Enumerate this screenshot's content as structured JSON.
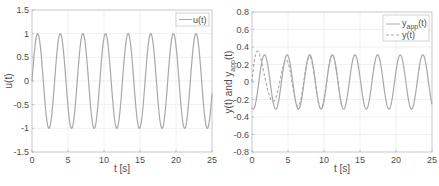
{
  "chart_data": [
    {
      "type": "line",
      "title": "",
      "xlabel": "t [s]",
      "ylabel": "u(t)",
      "xlim": [
        0,
        25
      ],
      "ylim": [
        -1.5,
        1.5
      ],
      "xticks": [
        0,
        5,
        10,
        15,
        20,
        25
      ],
      "yticks": [
        -1.5,
        -1,
        -0.5,
        0,
        0.5,
        1,
        1.5
      ],
      "ytick_labels": [
        "-1.5",
        "-1",
        "-0.5",
        "0",
        "0.5",
        "1",
        "1.5"
      ],
      "grid": true,
      "legend_position": "northeast",
      "series": [
        {
          "name": "u(t)",
          "style": "solid",
          "color": "#a8a8a8",
          "formula": "sin(2t)",
          "amplitude": 1.0,
          "angular_frequency": 2.0,
          "phase": 0.0,
          "x": [
            0,
            0.785,
            2.356,
            3.927,
            5.498,
            7.069,
            8.639,
            10.21,
            11.78,
            13.35,
            14.92,
            16.49,
            18.06,
            19.63,
            21.21,
            22.78,
            24.35,
            25
          ],
          "values": [
            0,
            1,
            -1,
            1,
            -1,
            1,
            -1,
            1,
            -1,
            1,
            -1,
            1,
            -1,
            1,
            -1,
            1,
            -1,
            -0.26
          ]
        }
      ]
    },
    {
      "type": "line",
      "title": "",
      "xlabel": "t [s]",
      "ylabel": "y(t) and y_app(t)",
      "xlim": [
        0,
        25
      ],
      "ylim": [
        -0.8,
        0.8
      ],
      "xticks": [
        0,
        5,
        10,
        15,
        20,
        25
      ],
      "yticks": [
        -0.8,
        -0.6,
        -0.4,
        -0.2,
        0,
        0.2,
        0.4,
        0.6,
        0.8
      ],
      "ytick_labels": [
        "-0.8",
        "-0.6",
        "-0.4",
        "-0.2",
        "0",
        "0.2",
        "0.4",
        "0.6",
        "0.8"
      ],
      "grid": true,
      "legend_position": "northeast",
      "series": [
        {
          "name": "y_app(t)",
          "style": "solid",
          "color": "#a8a8a8",
          "amplitude": 0.31,
          "angular_frequency": 2.0,
          "phase": -1.9,
          "x": [
            0,
            0.6,
            2.2,
            3.75,
            5.35,
            6.9,
            8.5,
            10.1,
            11.6,
            13.2,
            14.8,
            16.4,
            17.9,
            19.5,
            21.1,
            22.6,
            24.2,
            25
          ],
          "values": [
            -0.29,
            -0.31,
            0.31,
            -0.31,
            0.31,
            -0.31,
            0.31,
            -0.31,
            0.31,
            -0.31,
            0.31,
            -0.31,
            0.31,
            -0.31,
            0.31,
            -0.31,
            0.31,
            0.0
          ]
        },
        {
          "name": "y(t)",
          "style": "dashed",
          "color": "#a8a8a8",
          "x": [
            0,
            1.0,
            2.0,
            3.0,
            4.3,
            5.5,
            7.0,
            8.5,
            10.1,
            11.6
          ],
          "values": [
            0,
            0.35,
            0.64,
            0.05,
            -0.47,
            0.1,
            -0.32,
            0.37,
            -0.31,
            0.31
          ],
          "transient_decay_tau": 2.5
        }
      ]
    }
  ],
  "plots": {
    "left": {
      "xlabel": "t [s]",
      "ylabel": "u(t)",
      "legend": [
        "u(t)"
      ]
    },
    "right": {
      "xlabel": "t [s]",
      "ylabel_main": "y(t) and y",
      "ylabel_sub": "app",
      "ylabel_tail": "(t)",
      "legend": [
        {
          "main": "y",
          "sub": "app",
          "tail": "(t)"
        },
        {
          "main": "y(t)",
          "sub": "",
          "tail": ""
        }
      ]
    }
  },
  "colors": {
    "axis": "#262626",
    "frame": "#c8c8c8",
    "grid": "#ececec",
    "curve": "#a8a8a8",
    "text": "#4d4d4d"
  }
}
